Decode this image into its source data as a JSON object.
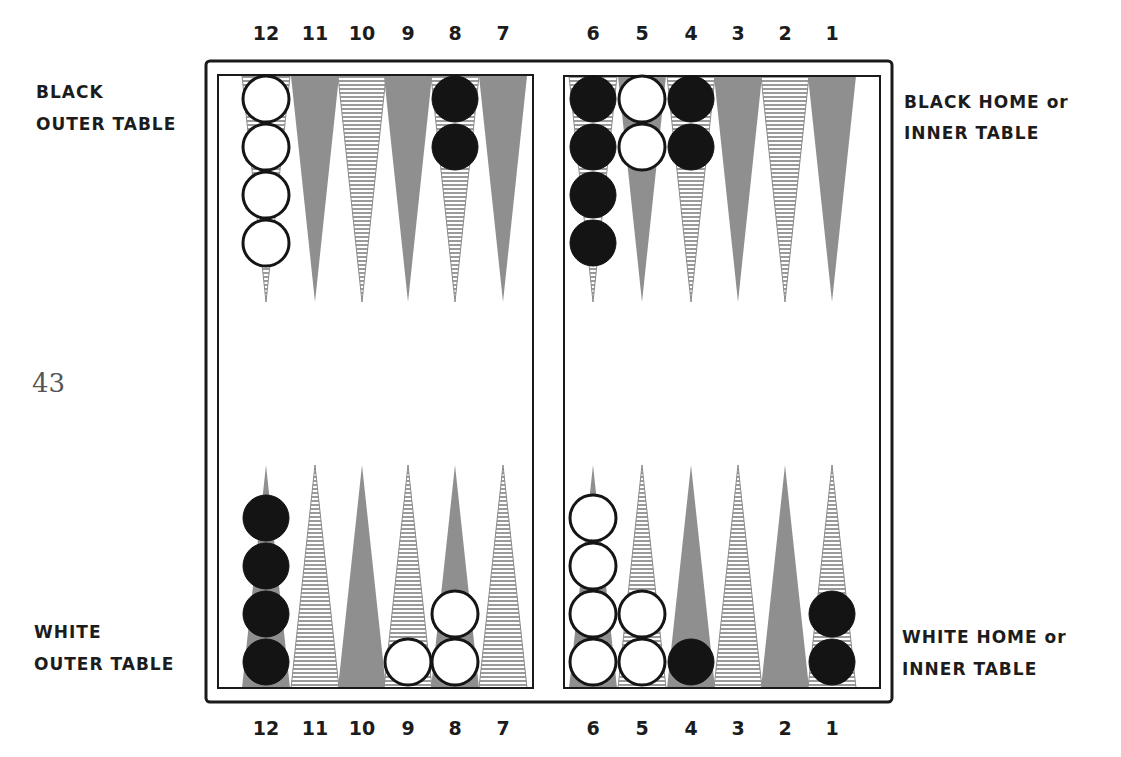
{
  "page_number": "43",
  "labels": {
    "black_outer": [
      "BLACK",
      "OUTER TABLE"
    ],
    "black_home": [
      "BLACK HOME or",
      "INNER TABLE"
    ],
    "white_outer": [
      "WHITE",
      "OUTER TABLE"
    ],
    "white_home": [
      "WHITE HOME or",
      "INNER TABLE"
    ]
  },
  "point_numbers": {
    "top": [
      "12",
      "11",
      "10",
      "9",
      "8",
      "7",
      "6",
      "5",
      "4",
      "3",
      "2",
      "1"
    ],
    "bottom": [
      "12",
      "11",
      "10",
      "9",
      "8",
      "7",
      "6",
      "5",
      "4",
      "3",
      "2",
      "1"
    ]
  },
  "colors": {
    "frame": "#1a1a1a",
    "gray_point": "#8f8f8f",
    "striped_point": "#9a9a9a",
    "black_checker": "#141414",
    "white_checker": "#ffffff"
  },
  "board": {
    "top_points": [
      {
        "point": "12",
        "style": "striped",
        "checkers": {
          "color": "white",
          "count": 4
        }
      },
      {
        "point": "11",
        "style": "gray",
        "checkers": null
      },
      {
        "point": "10",
        "style": "striped",
        "checkers": null
      },
      {
        "point": "9",
        "style": "gray",
        "checkers": null
      },
      {
        "point": "8",
        "style": "striped",
        "checkers": {
          "color": "black",
          "count": 2
        }
      },
      {
        "point": "7",
        "style": "gray",
        "checkers": null
      },
      {
        "point": "6",
        "style": "striped",
        "checkers": {
          "color": "black",
          "count": 4
        }
      },
      {
        "point": "5",
        "style": "gray",
        "checkers": {
          "color": "white",
          "count": 2
        }
      },
      {
        "point": "4",
        "style": "striped",
        "checkers": {
          "color": "black",
          "count": 2
        }
      },
      {
        "point": "3",
        "style": "gray",
        "checkers": null
      },
      {
        "point": "2",
        "style": "striped",
        "checkers": null
      },
      {
        "point": "1",
        "style": "gray",
        "checkers": null
      }
    ],
    "bottom_points": [
      {
        "point": "12",
        "style": "gray",
        "checkers": {
          "color": "black",
          "count": 4
        }
      },
      {
        "point": "11",
        "style": "striped",
        "checkers": null
      },
      {
        "point": "10",
        "style": "gray",
        "checkers": null
      },
      {
        "point": "9",
        "style": "striped",
        "checkers": {
          "color": "white",
          "count": 1
        }
      },
      {
        "point": "8",
        "style": "gray",
        "checkers": {
          "color": "white",
          "count": 2
        }
      },
      {
        "point": "7",
        "style": "striped",
        "checkers": null
      },
      {
        "point": "6",
        "style": "gray",
        "checkers": {
          "color": "white",
          "count": 4
        }
      },
      {
        "point": "5",
        "style": "striped",
        "checkers": {
          "color": "white",
          "count": 2
        }
      },
      {
        "point": "4",
        "style": "gray",
        "checkers": {
          "color": "black",
          "count": 1
        }
      },
      {
        "point": "3",
        "style": "striped",
        "checkers": null
      },
      {
        "point": "2",
        "style": "gray",
        "checkers": null
      },
      {
        "point": "1",
        "style": "striped",
        "checkers": {
          "color": "black",
          "count": 2
        }
      }
    ]
  }
}
